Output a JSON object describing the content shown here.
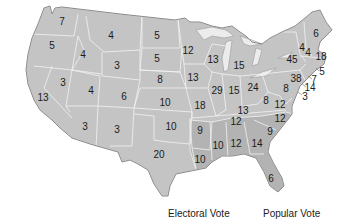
{
  "map": {
    "title": "United States Electoral Votes",
    "base_color": "#c4c4c4",
    "border_color": "#f2f2f2",
    "states": [
      {
        "id": "WA",
        "votes": "7",
        "x": 62,
        "y": 22
      },
      {
        "id": "OR",
        "votes": "5",
        "x": 52,
        "y": 46
      },
      {
        "id": "CA",
        "votes": "13",
        "x": 43,
        "y": 98
      },
      {
        "id": "ID",
        "votes": "4",
        "x": 83,
        "y": 55
      },
      {
        "id": "NV",
        "votes": "3",
        "x": 63,
        "y": 83
      },
      {
        "id": "MT",
        "votes": "4",
        "x": 111,
        "y": 36
      },
      {
        "id": "WY",
        "votes": "3",
        "x": 117,
        "y": 66
      },
      {
        "id": "UT",
        "votes": "4",
        "x": 91,
        "y": 91
      },
      {
        "id": "AZ",
        "votes": "3",
        "x": 85,
        "y": 127
      },
      {
        "id": "CO",
        "votes": "6",
        "x": 124,
        "y": 97
      },
      {
        "id": "NM",
        "votes": "3",
        "x": 117,
        "y": 130
      },
      {
        "id": "ND",
        "votes": "5",
        "x": 157,
        "y": 36
      },
      {
        "id": "SD",
        "votes": "5",
        "x": 157,
        "y": 59
      },
      {
        "id": "NE",
        "votes": "8",
        "x": 160,
        "y": 80
      },
      {
        "id": "KS",
        "votes": "10",
        "x": 165,
        "y": 103
      },
      {
        "id": "OK",
        "votes": "10",
        "x": 171,
        "y": 127
      },
      {
        "id": "TX",
        "votes": "20",
        "x": 159,
        "y": 155
      },
      {
        "id": "MN",
        "votes": "12",
        "x": 188,
        "y": 51
      },
      {
        "id": "IA",
        "votes": "13",
        "x": 193,
        "y": 78
      },
      {
        "id": "MO",
        "votes": "18",
        "x": 200,
        "y": 106
      },
      {
        "id": "AR",
        "votes": "9",
        "x": 200,
        "y": 131
      },
      {
        "id": "LA",
        "votes": "10",
        "x": 200,
        "y": 160
      },
      {
        "id": "WI",
        "votes": "13",
        "x": 213,
        "y": 60
      },
      {
        "id": "IL",
        "votes": "29",
        "x": 217,
        "y": 91
      },
      {
        "id": "MI",
        "votes": "15",
        "x": 239,
        "y": 66
      },
      {
        "id": "IN",
        "votes": "15",
        "x": 234,
        "y": 91
      },
      {
        "id": "OH",
        "votes": "24",
        "x": 253,
        "y": 88
      },
      {
        "id": "KY",
        "votes": "13",
        "x": 243,
        "y": 111
      },
      {
        "id": "TN",
        "votes": "12",
        "x": 236,
        "y": 122
      },
      {
        "id": "MS",
        "votes": "10",
        "x": 218,
        "y": 146
      },
      {
        "id": "AL",
        "votes": "12",
        "x": 236,
        "y": 144
      },
      {
        "id": "GA",
        "votes": "14",
        "x": 257,
        "y": 144
      },
      {
        "id": "FL",
        "votes": "6",
        "x": 271,
        "y": 179
      },
      {
        "id": "SC",
        "votes": "9",
        "x": 270,
        "y": 132
      },
      {
        "id": "NC",
        "votes": "12",
        "x": 280,
        "y": 119
      },
      {
        "id": "VA",
        "votes": "12",
        "x": 280,
        "y": 105
      },
      {
        "id": "WV",
        "votes": "8",
        "x": 266,
        "y": 101
      },
      {
        "id": "PA",
        "votes": "38",
        "x": 296,
        "y": 79
      },
      {
        "id": "MD",
        "votes": "8",
        "x": 286,
        "y": 89
      },
      {
        "id": "NY",
        "votes": "45",
        "x": 292,
        "y": 60
      },
      {
        "id": "VT",
        "votes": "4",
        "x": 302,
        "y": 48
      },
      {
        "id": "NH",
        "votes": "4",
        "x": 308,
        "y": 53
      },
      {
        "id": "ME",
        "votes": "6",
        "x": 316,
        "y": 34
      },
      {
        "id": "MA",
        "votes": "18",
        "x": 321,
        "y": 57
      },
      {
        "id": "RI",
        "votes": "5",
        "x": 322,
        "y": 72
      },
      {
        "id": "CT",
        "votes": "7",
        "x": 314,
        "y": 80
      },
      {
        "id": "NJ",
        "votes": "14",
        "x": 310,
        "y": 88
      },
      {
        "id": "DE",
        "votes": "3",
        "x": 305,
        "y": 97
      }
    ]
  },
  "legend": {
    "electoral_label": "Electoral Vote",
    "popular_label": "Popular Vote"
  }
}
